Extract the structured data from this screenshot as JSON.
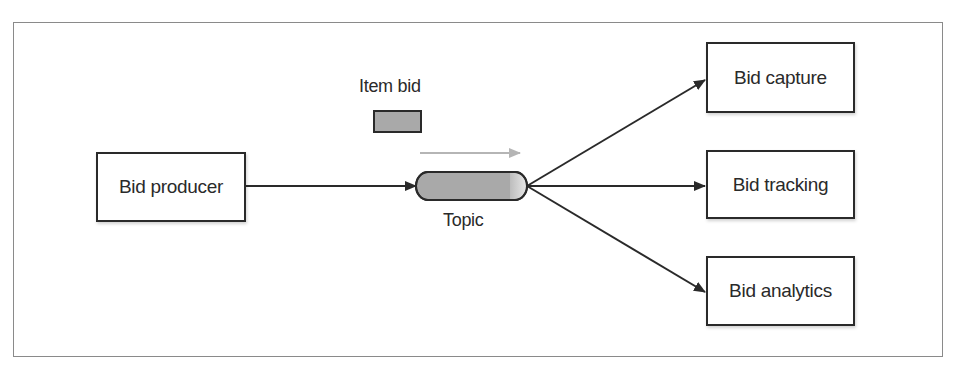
{
  "diagram": {
    "producer": {
      "label": "Bid producer"
    },
    "message": {
      "label": "Item bid",
      "color": "#a9a9a9"
    },
    "topic": {
      "label": "Topic",
      "fill": "#a9a9a9",
      "cap_fill": "#d8d8d8"
    },
    "flow_arrow": {
      "color": "#b5b5b5"
    },
    "consumers": [
      {
        "label": "Bid capture"
      },
      {
        "label": "Bid tracking"
      },
      {
        "label": "Bid analytics"
      }
    ],
    "edges": [
      {
        "from": "Bid producer",
        "to": "Topic"
      },
      {
        "from": "Topic",
        "to": "Bid capture"
      },
      {
        "from": "Topic",
        "to": "Bid tracking"
      },
      {
        "from": "Topic",
        "to": "Bid analytics"
      }
    ],
    "line_color": "#2a2a2a"
  }
}
